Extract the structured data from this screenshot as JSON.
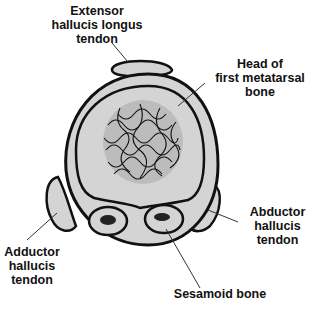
{
  "diagram": {
    "colors": {
      "fill": "#d4d4d4",
      "stroke": "#111111",
      "background": "#ffffff"
    },
    "labels": {
      "extensor": [
        "Extensor",
        "hallucis longus",
        "tendon"
      ],
      "head": [
        "Head of",
        "first metatarsal",
        "bone"
      ],
      "abductor": [
        "Abductor",
        "hallucis",
        "tendon"
      ],
      "adductor": [
        "Adductor",
        "hallucis",
        "tendon"
      ],
      "sesamoid": [
        "Sesamoid bone"
      ]
    }
  }
}
